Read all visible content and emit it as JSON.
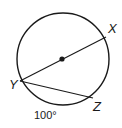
{
  "diagram": {
    "type": "circle-geometry",
    "points": [
      {
        "name": "X",
        "label": "X"
      },
      {
        "name": "Y",
        "label": "Y"
      },
      {
        "name": "Z",
        "label": "Z"
      }
    ],
    "segments": [
      "YX (diameter through center)",
      "YZ (chord)"
    ],
    "arc_label": "100°",
    "colors": {
      "stroke": "#1a1a1a",
      "background": "#ffffff"
    }
  }
}
